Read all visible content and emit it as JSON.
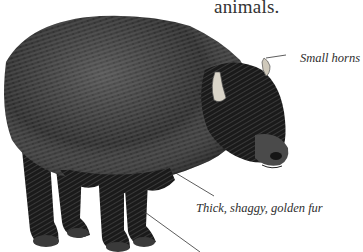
{
  "page": {
    "intro_fragment": "animals.",
    "illustration": {
      "subject": "shaggy horned bovine (yak)",
      "style": "black-and-white engraving"
    },
    "callouts": [
      {
        "label": "Small horns"
      },
      {
        "label": "Thick, shaggy, golden fur"
      }
    ]
  },
  "colors": {
    "background": "#ffffff",
    "text": "#2b2b2b",
    "fur_dark": "#1c1c1c",
    "fur_mid": "#3d3d3d",
    "fur_light": "#8a8a8a",
    "horn": "#d9d4c8",
    "leader_line": "#333333"
  }
}
